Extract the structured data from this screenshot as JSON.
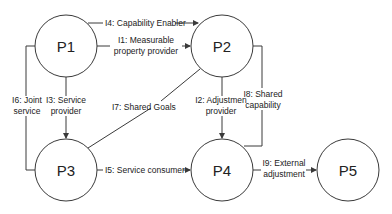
{
  "nodes": [
    {
      "id": "P1",
      "label": "P1",
      "cx": 66,
      "cy": 46,
      "r": 31
    },
    {
      "id": "P2",
      "label": "P2",
      "cx": 222,
      "cy": 46,
      "r": 31
    },
    {
      "id": "P3",
      "label": "P3",
      "cx": 66,
      "cy": 170,
      "r": 31
    },
    {
      "id": "P4",
      "label": "P4",
      "cx": 222,
      "cy": 170,
      "r": 31
    },
    {
      "id": "P5",
      "label": "P5",
      "cx": 348,
      "cy": 170,
      "r": 31
    }
  ],
  "edges": [
    {
      "id": "I4",
      "from": "P1",
      "to": "P2",
      "label": "I4: Capability Enabler"
    },
    {
      "id": "I1",
      "from": "P1",
      "to": "P2",
      "label_lines": [
        "I1: Measurable",
        "property provider"
      ]
    },
    {
      "id": "I3",
      "from": "P1",
      "to": "P3",
      "label_lines": [
        "I3: Service",
        "provider"
      ]
    },
    {
      "id": "I6",
      "from": "P1",
      "to": "P3",
      "label_lines": [
        "I6: Joint",
        "service"
      ]
    },
    {
      "id": "I7",
      "from": "P3",
      "to": "P2",
      "label": "I7: Shared Goals"
    },
    {
      "id": "I2",
      "from": "P2",
      "to": "P4",
      "label_lines": [
        "I2: Adjustmen",
        "provider"
      ]
    },
    {
      "id": "I8",
      "from": "P2",
      "to": "P4",
      "label_lines": [
        "I8: Shared",
        "capability"
      ]
    },
    {
      "id": "I5",
      "from": "P3",
      "to": "P4",
      "label": "I5: Service consumer"
    },
    {
      "id": "I9",
      "from": "P4",
      "to": "P5",
      "label_lines": [
        "I9: External",
        "adjustment"
      ]
    }
  ],
  "labels": {
    "p1": "P1",
    "p2": "P2",
    "p3": "P3",
    "p4": "P4",
    "p5": "P5",
    "i4": "I4: Capability Enabler",
    "i1_l1": "I1: Measurable",
    "i1_l2": "property provider",
    "i3_l1": "I3: Service",
    "i3_l2": "provider",
    "i6_l1": "I6: Joint",
    "i6_l2": "service",
    "i7": "I7: Shared Goals",
    "i2_l1": "I2: Adjustmen",
    "i2_l2": "provider",
    "i8_l1": "I8: Shared",
    "i8_l2": "capability",
    "i5": "I5: Service consumer",
    "i9_l1": "I9: External",
    "i9_l2": "adjustment"
  },
  "colors": {
    "stroke": "#3a3a3a",
    "text": "#222222",
    "background": "#ffffff"
  }
}
